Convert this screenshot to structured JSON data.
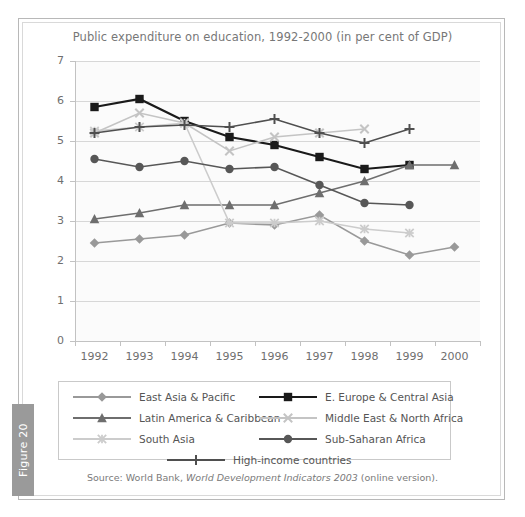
{
  "figure": {
    "tab_label": "Figure 20",
    "source_prefix": "Source: World Bank, ",
    "source_italic": "World Development Indicators 2003",
    "source_suffix": " (online version)."
  },
  "chart_data": {
    "type": "line",
    "title": "Public expenditure on education, 1992-2000 (in per cent  of GDP)",
    "xlabel": "",
    "ylabel": "",
    "ylim": [
      0,
      7
    ],
    "yticks": [
      0,
      1,
      2,
      3,
      4,
      5,
      6,
      7
    ],
    "grid": true,
    "legend_position": "bottom",
    "categories": [
      "1992",
      "1993",
      "1994",
      "1995",
      "1996",
      "1997",
      "1998",
      "1999",
      "2000"
    ],
    "series": [
      {
        "name": "East Asia & Pacific",
        "marker": "diamond",
        "color": "#999999",
        "values": [
          2.45,
          2.55,
          2.65,
          2.95,
          2.9,
          3.15,
          2.5,
          2.15,
          2.35
        ]
      },
      {
        "name": "E. Europe & Central Asia",
        "marker": "square",
        "color": "#1a1a1a",
        "values": [
          5.85,
          6.05,
          5.5,
          5.1,
          4.9,
          4.6,
          4.3,
          4.4,
          null
        ]
      },
      {
        "name": "Latin America & Caribbean",
        "marker": "triangle",
        "color": "#6e6e6e",
        "values": [
          3.05,
          3.2,
          3.4,
          3.4,
          3.4,
          3.7,
          4.0,
          4.4,
          4.4
        ]
      },
      {
        "name": "Middle East & North Africa",
        "marker": "x",
        "color": "#c4c4c4",
        "values": [
          5.2,
          5.7,
          5.45,
          4.75,
          5.1,
          5.2,
          5.3,
          null,
          null
        ]
      },
      {
        "name": "South Asia",
        "marker": "star",
        "color": "#cccccc",
        "values": [
          5.25,
          5.35,
          5.45,
          2.95,
          2.95,
          3.0,
          2.8,
          2.7,
          null
        ]
      },
      {
        "name": "Sub-Saharan Africa",
        "marker": "circle",
        "color": "#575757",
        "values": [
          4.55,
          4.35,
          4.5,
          4.3,
          4.35,
          3.9,
          3.45,
          3.4,
          null
        ]
      },
      {
        "name": "High-income countries",
        "marker": "plus",
        "color": "#4f4f4f",
        "values": [
          5.2,
          5.35,
          5.4,
          5.35,
          5.55,
          5.2,
          4.95,
          5.3,
          null
        ]
      }
    ]
  }
}
